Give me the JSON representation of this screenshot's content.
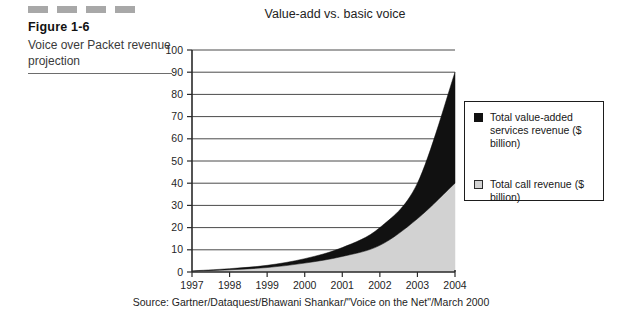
{
  "caption": {
    "dash_count": 4,
    "figure_label": "Figure 1-6",
    "description": "Voice over Packet revenue projection"
  },
  "chart_data": {
    "type": "area",
    "stacked": true,
    "title": "Value-add vs. basic voice",
    "xlabel": "",
    "ylabel": "",
    "categories": [
      "1997",
      "1998",
      "1999",
      "2000",
      "2001",
      "2002",
      "2003",
      "2004"
    ],
    "ylim": [
      0,
      100
    ],
    "ytick_step": 10,
    "yticks": [
      "100",
      "90",
      "80",
      "70",
      "60",
      "50",
      "40",
      "30",
      "20",
      "10",
      "0"
    ],
    "grid": true,
    "legend_position": "right",
    "series": [
      {
        "name": "Total call revenue ($ billion)",
        "color": "#d2d2d2",
        "values": [
          0.3,
          1,
          2,
          4,
          7,
          12,
          24,
          40
        ]
      },
      {
        "name": "Total value-added services revenue ($ billion)",
        "color": "#111111",
        "values": [
          0.2,
          0.5,
          1,
          2,
          4,
          8,
          16,
          50
        ]
      }
    ],
    "totals": [
      0.5,
      1.5,
      3,
      6,
      11,
      20,
      40,
      90
    ],
    "annotations": []
  },
  "legend": {
    "items": [
      {
        "swatch": "dark",
        "label": "Total value-added services revenue ($ billion)"
      },
      {
        "swatch": "light",
        "label": "Total call revenue ($ billion)"
      }
    ]
  },
  "source": "Source: Gartner/Dataquest/Bhawani Shankar/\"Voice on the Net\"/March 2000",
  "colors": {
    "value_added": "#111111",
    "call_revenue": "#d2d2d2",
    "axis": "#2a2a2a",
    "grid": "#4a4a4a",
    "dash": "#a8a8a8"
  }
}
